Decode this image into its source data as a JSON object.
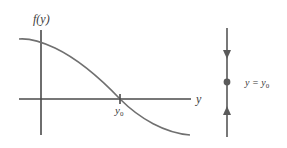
{
  "graph": {
    "ylabel": "f(y)",
    "xlabel": "y",
    "root_label_base": "y",
    "root_label_sub": "0",
    "axis_color": "#4a4a4a",
    "curve_color": "#707070"
  },
  "phase_line": {
    "label_lhs": "y = y",
    "label_sub": "0",
    "equilibrium": "y = y0",
    "arrow_above": "down",
    "arrow_below": "up",
    "line_color": "#6a6a6a"
  }
}
